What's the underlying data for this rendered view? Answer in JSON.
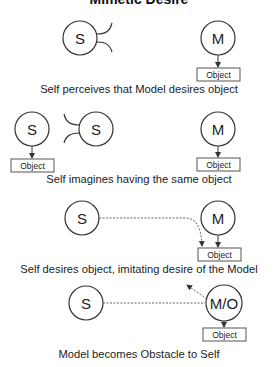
{
  "title": "Mimetic Desire",
  "sections": [
    {
      "caption": "Self perceives that Model desires object",
      "nodes": {
        "self": "S",
        "model": "M",
        "object": "Object"
      }
    },
    {
      "caption": "Self imagines having the same object",
      "nodes": {
        "self_imagined": "S",
        "self": "S",
        "model": "M",
        "object_self": "Object",
        "object_model": "Object"
      }
    },
    {
      "caption": "Self desires object, imitating desire of the Model",
      "nodes": {
        "self": "S",
        "model": "M",
        "object": "Object"
      }
    },
    {
      "caption": "Model becomes Obstacle to Self",
      "nodes": {
        "self": "S",
        "model_obstacle": "M/O",
        "object": "Object"
      }
    }
  ],
  "colors": {
    "stroke": "#333333",
    "dashed": "#666666",
    "text": "#222222"
  }
}
